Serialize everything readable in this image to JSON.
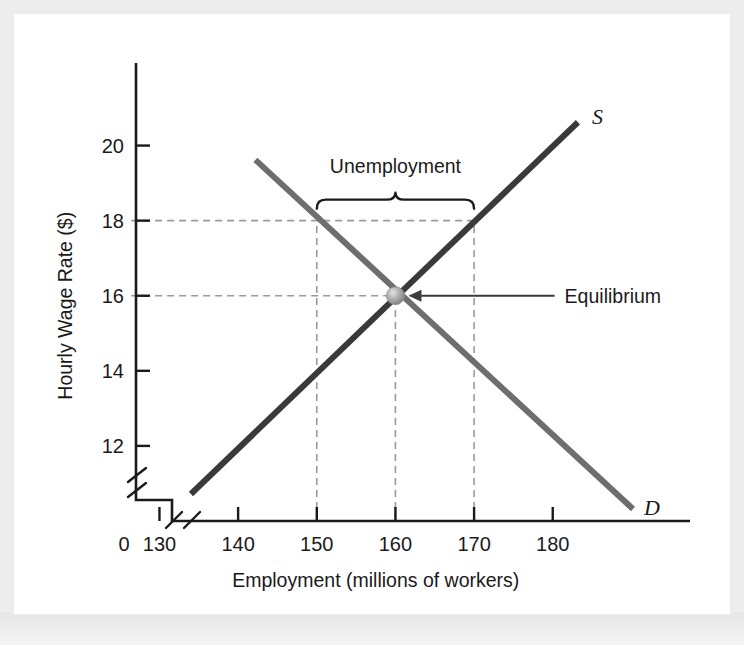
{
  "figure": {
    "background_color": "#f2f2f2",
    "plate_color": "#ffffff"
  },
  "chart_data": {
    "type": "line",
    "title": "",
    "xlabel": "Employment (millions of workers)",
    "ylabel": "Hourly Wage Rate ($)",
    "xlim": [
      126,
      193
    ],
    "ylim": [
      10,
      21.4
    ],
    "xticks": [
      130,
      140,
      150,
      160,
      170,
      180
    ],
    "xtick_labels": [
      "130",
      "140",
      "150",
      "160",
      "170",
      "180"
    ],
    "yticks": [
      12,
      14,
      16,
      18,
      20
    ],
    "ytick_labels": [
      "12",
      "14",
      "16",
      "18",
      "20"
    ],
    "origin_label": "0",
    "grid": false,
    "axis_break_x": true,
    "axis_break_y": true,
    "legend": "none",
    "series": [
      {
        "name": "S",
        "label": "S",
        "role": "supply",
        "color": "#3a3a3a",
        "width": 6,
        "points": [
          [
            134,
            10.72
          ],
          [
            183.2,
            20.62
          ]
        ]
      },
      {
        "name": "D",
        "label": "D",
        "role": "demand",
        "color": "#6e6e6e",
        "width": 6,
        "points": [
          [
            142.2,
            19.62
          ],
          [
            190.2,
            10.32
          ]
        ]
      }
    ],
    "equilibrium": {
      "label": "Equilibrium",
      "x": 160,
      "y": 16,
      "marker": "sphere",
      "marker_color": "#a8a8a8",
      "marker_radius": 9
    },
    "minimum_wage": {
      "wage": 18,
      "quantity_demanded": 150,
      "quantity_supplied": 170
    },
    "annotations": [
      {
        "name": "unemployment-bracket",
        "text": "Unemployment",
        "x_start": 150,
        "x_end": 170,
        "y": 18,
        "text_x": 160,
        "text_y": 19.05
      },
      {
        "name": "equilibrium-pointer",
        "text": "Equilibrium",
        "target_x": 160,
        "target_y": 16,
        "text_x": 181,
        "text_y": 16
      }
    ],
    "guides": [
      {
        "name": "wage-18-horizontal",
        "type": "h",
        "y": 18,
        "x_from": 126.4,
        "x_to": 170
      },
      {
        "name": "wage-16-horizontal",
        "type": "h",
        "y": 16,
        "x_from": 126.4,
        "x_to": 160
      },
      {
        "name": "qd-150-vertical",
        "type": "v",
        "x": 150,
        "y_from": 10,
        "y_to": 18
      },
      {
        "name": "qe-160-vertical",
        "type": "v",
        "x": 160,
        "y_from": 10,
        "y_to": 16
      },
      {
        "name": "qs-170-vertical",
        "type": "v",
        "x": 170,
        "y_from": 10,
        "y_to": 18
      }
    ]
  }
}
